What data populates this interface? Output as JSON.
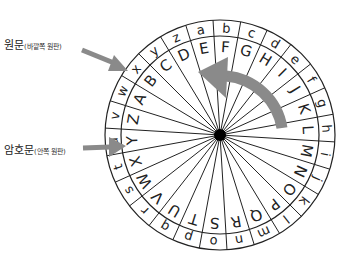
{
  "labels": {
    "plaintext": {
      "main": "원문",
      "sub": "(바깥쪽 원판)"
    },
    "ciphertext": {
      "main": "암호문",
      "sub": "(안쪽 원판)"
    }
  },
  "wheel": {
    "outer_letters": [
      "a",
      "b",
      "c",
      "d",
      "e",
      "f",
      "g",
      "h",
      "i",
      "j",
      "k",
      "l",
      "m",
      "n",
      "o",
      "p",
      "q",
      "r",
      "s",
      "t",
      "u",
      "v",
      "w",
      "x",
      "y",
      "z"
    ],
    "inner_letters": [
      "E",
      "F",
      "G",
      "H",
      "I",
      "J",
      "K",
      "L",
      "M",
      "N",
      "O",
      "P",
      "Q",
      "R",
      "S",
      "T",
      "U",
      "V",
      "W",
      "X",
      "Y",
      "Z",
      "A",
      "B",
      "C",
      "D"
    ],
    "shift": 4,
    "rotation_direction": "counterclockwise"
  },
  "colors": {
    "arrow": "#8a8a8a",
    "line": "#222222",
    "background": "#ffffff"
  }
}
